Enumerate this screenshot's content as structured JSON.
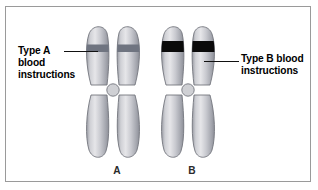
{
  "figure": {
    "kind": "chromosome-comparison-diagram",
    "background_color": "#ffffff",
    "border_color": "#9a9a9a"
  },
  "labels": {
    "left": {
      "text": "Type A\nblood\ninstructions",
      "lines": [
        "Type A",
        "blood",
        "instructions"
      ],
      "points_to": "chromosome-a-band"
    },
    "right": {
      "text": "Type B blood\ninstructions",
      "lines": [
        "Type B blood",
        "instructions"
      ],
      "points_to": "chromosome-b-band"
    }
  },
  "chromosomes": [
    {
      "id": "A",
      "name": "A",
      "band_color": "#6f7480",
      "band_label": "Type A blood instructions",
      "band_thickness": "thin",
      "arm_fill_light": "#e3e3e6",
      "arm_fill_mid": "#b6b7bd",
      "arm_fill_dark": "#8e9098",
      "outline_color": "#74767e"
    },
    {
      "id": "B",
      "name": "B",
      "band_color": "#0a0a0a",
      "band_label": "Type B blood instructions",
      "band_thickness": "thick",
      "arm_fill_light": "#e3e3e6",
      "arm_fill_mid": "#b6b7bd",
      "arm_fill_dark": "#8e9098",
      "outline_color": "#74767e"
    }
  ],
  "centromere": {
    "fill": "#cfd0d4",
    "outline": "#74767e"
  }
}
